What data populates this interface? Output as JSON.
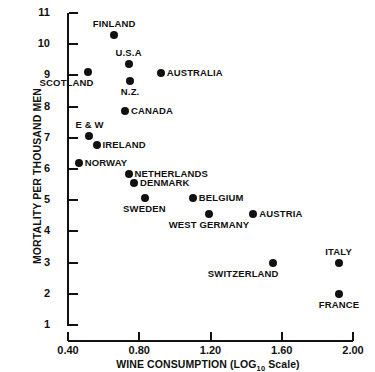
{
  "chart_data": {
    "type": "scatter",
    "title": "",
    "xlabel": "WINE CONSUMPTION (LOG10 Scale)",
    "xlabel_main": "WINE CONSUMPTION (LOG",
    "xlabel_sub": "10",
    "xlabel_tail": " Scale)",
    "ylabel": "MORTALITY PER THOUSAND MEN",
    "xlim": [
      0.4,
      2.0
    ],
    "ylim": [
      1,
      11
    ],
    "xticks": [
      "0.40",
      "0.80",
      "1.20",
      "1.60",
      "2.00"
    ],
    "yticks": [
      "11",
      "10",
      "9",
      "8",
      "7",
      "6",
      "5",
      "4",
      "3",
      "2",
      "1"
    ],
    "grid": false,
    "legend": "none",
    "marker_color": "#111111",
    "axis_color": "#111111",
    "points": [
      {
        "label": "FINLAND",
        "x": 0.66,
        "y": 10.3,
        "label_pos": "top"
      },
      {
        "label": "U.S.A",
        "x": 0.74,
        "y": 9.35,
        "label_pos": "top"
      },
      {
        "label": "SCOTLAND",
        "x": 0.51,
        "y": 9.1,
        "label_pos": "bottom-left"
      },
      {
        "label": "AUSTRALIA",
        "x": 0.92,
        "y": 9.08,
        "label_pos": "right"
      },
      {
        "label": "N.Z.",
        "x": 0.75,
        "y": 8.82,
        "label_pos": "bottom"
      },
      {
        "label": "CANADA",
        "x": 0.72,
        "y": 7.85,
        "label_pos": "right"
      },
      {
        "label": "E & W",
        "x": 0.52,
        "y": 7.05,
        "label_pos": "top"
      },
      {
        "label": "IRELAND",
        "x": 0.56,
        "y": 6.78,
        "label_pos": "right"
      },
      {
        "label": "NORWAY",
        "x": 0.46,
        "y": 6.2,
        "label_pos": "right"
      },
      {
        "label": "NETHERLANDS",
        "x": 0.74,
        "y": 5.84,
        "label_pos": "right"
      },
      {
        "label": "DENMARK",
        "x": 0.77,
        "y": 5.55,
        "label_pos": "right"
      },
      {
        "label": "SWEDEN",
        "x": 0.83,
        "y": 5.07,
        "label_pos": "bottom"
      },
      {
        "label": "BELGIUM",
        "x": 1.1,
        "y": 5.07,
        "label_pos": "right"
      },
      {
        "label": "WEST GERMANY",
        "x": 1.19,
        "y": 4.55,
        "label_pos": "bottom"
      },
      {
        "label": "AUSTRIA",
        "x": 1.44,
        "y": 4.55,
        "label_pos": "right"
      },
      {
        "label": "SWITZERLAND",
        "x": 1.55,
        "y": 2.99,
        "label_pos": "bottom-left"
      },
      {
        "label": "ITALY",
        "x": 1.92,
        "y": 2.99,
        "label_pos": "top"
      },
      {
        "label": "FRANCE",
        "x": 1.92,
        "y": 1.99,
        "label_pos": "bottom"
      }
    ]
  }
}
